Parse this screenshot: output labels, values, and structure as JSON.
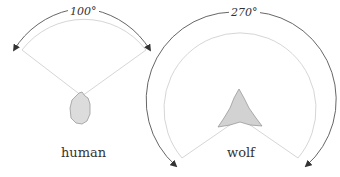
{
  "diagram": {
    "panels": [
      {
        "id": "human",
        "label": "human",
        "angle_label": "100°",
        "angle": 100
      },
      {
        "id": "wolf",
        "label": "wolf",
        "angle_label": "270°",
        "angle": 270
      }
    ],
    "colors": {
      "arrow": "#555555",
      "field_edge": "#d4d4d4",
      "head_fill": "#dcdcdc",
      "head_stroke": "#999999"
    }
  }
}
